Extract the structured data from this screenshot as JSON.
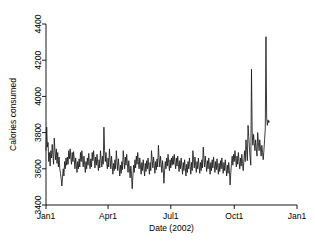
{
  "chart_data": {
    "type": "line",
    "title": "",
    "subtitle": "",
    "xlabel": "Date (2002)",
    "ylabel": "Calories consumed",
    "grid": false,
    "legend": null,
    "xlim": [
      0,
      364
    ],
    "ylim": [
      3400,
      4400
    ],
    "ytick_values": [
      3400,
      3600,
      3800,
      4000,
      4200,
      4400
    ],
    "ytick_labels": [
      "3400",
      "3600",
      "3800",
      "4000",
      "4200",
      "4400"
    ],
    "xtick_values": [
      0,
      90,
      181,
      273,
      364
    ],
    "xtick_labels": [
      "Jan1",
      "Apr1",
      "Jul1",
      "Oct1",
      "Jan1"
    ],
    "series_name": "Calories consumed",
    "line_color": "#1a1a1a",
    "x": [
      0,
      1,
      2,
      3,
      4,
      5,
      6,
      7,
      8,
      9,
      10,
      11,
      12,
      13,
      14,
      15,
      16,
      17,
      18,
      19,
      20,
      21,
      22,
      23,
      24,
      25,
      26,
      27,
      28,
      29,
      30,
      31,
      32,
      33,
      34,
      35,
      36,
      37,
      38,
      39,
      40,
      41,
      42,
      43,
      44,
      45,
      46,
      47,
      48,
      49,
      50,
      51,
      52,
      53,
      54,
      55,
      56,
      57,
      58,
      59,
      60,
      61,
      62,
      63,
      64,
      65,
      66,
      67,
      68,
      69,
      70,
      71,
      72,
      73,
      74,
      75,
      76,
      77,
      78,
      79,
      80,
      81,
      82,
      83,
      84,
      85,
      86,
      87,
      88,
      89,
      90,
      91,
      92,
      93,
      94,
      95,
      96,
      97,
      98,
      99,
      100,
      101,
      102,
      103,
      104,
      105,
      106,
      107,
      108,
      109,
      110,
      111,
      112,
      113,
      114,
      115,
      116,
      117,
      118,
      119,
      120,
      121,
      122,
      123,
      124,
      125,
      126,
      127,
      128,
      129,
      130,
      131,
      132,
      133,
      134,
      135,
      136,
      137,
      138,
      139,
      140,
      141,
      142,
      143,
      144,
      145,
      146,
      147,
      148,
      149,
      150,
      151,
      152,
      153,
      154,
      155,
      156,
      157,
      158,
      159,
      160,
      161,
      162,
      163,
      164,
      165,
      166,
      167,
      168,
      169,
      170,
      171,
      172,
      173,
      174,
      175,
      176,
      177,
      178,
      179,
      180,
      181,
      182,
      183,
      184,
      185,
      186,
      187,
      188,
      189,
      190,
      191,
      192,
      193,
      194,
      195,
      196,
      197,
      198,
      199,
      200,
      201,
      202,
      203,
      204,
      205,
      206,
      207,
      208,
      209,
      210,
      211,
      212,
      213,
      214,
      215,
      216,
      217,
      218,
      219,
      220,
      221,
      222,
      223,
      224,
      225,
      226,
      227,
      228,
      229,
      230,
      231,
      232,
      233,
      234,
      235,
      236,
      237,
      238,
      239,
      240,
      241,
      242,
      243,
      244,
      245,
      246,
      247,
      248,
      249,
      250,
      251,
      252,
      253,
      254,
      255,
      256,
      257,
      258,
      259,
      260,
      261,
      262,
      263,
      264,
      265,
      266,
      267,
      268,
      269,
      270,
      271,
      272,
      273,
      274,
      275,
      276,
      277,
      278,
      279,
      280,
      281,
      282,
      283,
      284,
      285,
      286,
      287,
      288,
      289,
      290,
      291,
      292,
      293,
      294,
      295,
      296,
      297,
      298,
      299,
      300,
      301,
      302,
      303,
      304,
      305,
      306,
      307,
      308,
      309,
      310,
      311,
      312,
      313,
      314,
      315,
      316,
      317,
      318,
      319,
      320,
      321,
      322,
      323,
      324,
      325,
      326,
      327,
      328,
      329,
      330,
      331,
      332,
      333,
      334,
      335,
      336,
      337,
      338,
      339,
      340,
      341,
      342,
      343,
      344,
      345,
      346,
      347,
      348,
      349,
      350,
      351,
      352,
      353,
      354,
      355,
      356,
      357,
      358,
      359,
      360,
      361,
      362,
      363,
      364
    ],
    "y": [
      3700,
      3830,
      3720,
      3745,
      3640,
      3690,
      3615,
      3700,
      3660,
      3735,
      3680,
      3625,
      3770,
      3700,
      3650,
      3710,
      3630,
      3690,
      3610,
      3665,
      3600,
      3575,
      3545,
      3505,
      3555,
      3600,
      3560,
      3640,
      3600,
      3660,
      3620,
      3665,
      3625,
      3700,
      3655,
      3710,
      3660,
      3625,
      3690,
      3640,
      3695,
      3650,
      3600,
      3660,
      3620,
      3580,
      3640,
      3600,
      3655,
      3610,
      3690,
      3640,
      3700,
      3650,
      3610,
      3670,
      3625,
      3580,
      3640,
      3600,
      3660,
      3620,
      3685,
      3630,
      3600,
      3655,
      3610,
      3690,
      3645,
      3700,
      3650,
      3605,
      3665,
      3620,
      3680,
      3630,
      3590,
      3650,
      3605,
      3700,
      3650,
      3610,
      3670,
      3625,
      3830,
      3700,
      3640,
      3690,
      3630,
      3600,
      3660,
      3610,
      3710,
      3650,
      3600,
      3670,
      3620,
      3570,
      3630,
      3590,
      3650,
      3600,
      3700,
      3640,
      3590,
      3655,
      3610,
      3560,
      3620,
      3575,
      3640,
      3595,
      3700,
      3650,
      3600,
      3665,
      3620,
      3680,
      3630,
      3580,
      3645,
      3600,
      3550,
      3615,
      3570,
      3490,
      3560,
      3620,
      3580,
      3650,
      3605,
      3670,
      3625,
      3690,
      3640,
      3600,
      3660,
      3615,
      3570,
      3635,
      3590,
      3650,
      3605,
      3560,
      3630,
      3585,
      3645,
      3600,
      3660,
      3615,
      3570,
      3635,
      3590,
      3700,
      3650,
      3605,
      3665,
      3620,
      3575,
      3640,
      3595,
      3655,
      3610,
      3730,
      3660,
      3610,
      3670,
      3625,
      3580,
      3645,
      3600,
      3520,
      3590,
      3640,
      3600,
      3660,
      3615,
      3680,
      3630,
      3590,
      3650,
      3605,
      3660,
      3620,
      3670,
      3625,
      3680,
      3635,
      3600,
      3660,
      3615,
      3670,
      3625,
      3585,
      3645,
      3600,
      3660,
      3615,
      3570,
      3635,
      3590,
      3650,
      3605,
      3560,
      3625,
      3580,
      3640,
      3600,
      3660,
      3615,
      3570,
      3635,
      3590,
      3700,
      3650,
      3605,
      3665,
      3620,
      3580,
      3640,
      3600,
      3660,
      3615,
      3575,
      3635,
      3590,
      3650,
      3605,
      3720,
      3660,
      3610,
      3670,
      3625,
      3585,
      3645,
      3600,
      3660,
      3615,
      3570,
      3635,
      3590,
      3650,
      3605,
      3665,
      3620,
      3580,
      3640,
      3595,
      3655,
      3610,
      3570,
      3630,
      3585,
      3645,
      3600,
      3660,
      3615,
      3575,
      3635,
      3590,
      3650,
      3605,
      3560,
      3620,
      3575,
      3635,
      3590,
      3510,
      3580,
      3630,
      3670,
      3620,
      3680,
      3640,
      3700,
      3655,
      3610,
      3670,
      3625,
      3690,
      3640,
      3600,
      3660,
      3615,
      3680,
      3630,
      3590,
      3650,
      3700,
      3640,
      3760,
      3700,
      3645,
      3840,
      3780,
      3720,
      3660,
      3620,
      4150,
      3800,
      3730,
      3790,
      3740,
      3700,
      3760,
      3710,
      3670,
      3800,
      3745,
      3700,
      3760,
      3715,
      3670,
      3730,
      3690,
      3650,
      3700,
      3760,
      3820,
      4330,
      3880,
      3840,
      3870,
      3855,
      3865
    ]
  }
}
